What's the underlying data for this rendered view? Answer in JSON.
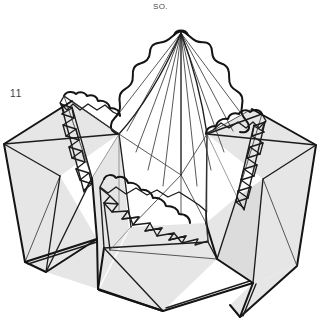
{
  "page": {
    "width": 321,
    "height": 327,
    "background_color": "#ffffff",
    "document_type": "origami-instruction-diagram"
  },
  "labels": {
    "top_caption": "SO.",
    "step_number": "11",
    "bottom_caption_partial": " "
  },
  "colors": {
    "ink": "#1a1a1a",
    "line_light": "#5a5a5a",
    "face_shaded": "#e6e6e6",
    "face_shaded_dark": "#dcdcdc",
    "face_white": "#ffffff",
    "background": "#ffffff",
    "label_text": "#3c3c3c",
    "caption_text": "#4a4a4a"
  },
  "figure": {
    "name": "folded-paper-model",
    "shaded_faces": [
      {
        "id": "left-outer-wing-upper",
        "points": "3,143 70,100 118,133 58,175",
        "fill": "#e6e6e6"
      },
      {
        "id": "left-outer-wing-lower",
        "points": "3,143 58,175 42,281 24,262",
        "fill": "#e6e6e6"
      },
      {
        "id": "left-outer-wing-lower2",
        "points": "58,175 95,238 42,281",
        "fill": "#e6e6e6"
      },
      {
        "id": "left-front-flap",
        "points": "90,180 118,133 128,226 96,290",
        "fill": "#e6e6e6"
      },
      {
        "id": "front-center-flap",
        "points": "96,290 128,226 205,222 215,260 160,312",
        "fill": "#e6e6e6"
      },
      {
        "id": "front-center-flap-lower",
        "points": "100,296 160,312 104,300",
        "fill": "#e6e6e6"
      },
      {
        "id": "right-front-flap",
        "points": "205,222 236,196 250,284 215,260",
        "fill": "#e6e6e6"
      },
      {
        "id": "right-outer-wing-upper",
        "points": "206,133 252,108 317,144 262,178",
        "fill": "#e6e6e6"
      },
      {
        "id": "right-outer-wing-lower",
        "points": "262,178 317,144 296,268 250,284",
        "fill": "#e6e6e6"
      },
      {
        "id": "right-outer-wing-lower2",
        "points": "236,196 262,178 250,284",
        "fill": "#dcdcdc"
      }
    ],
    "cones": [
      {
        "id": "center-cone",
        "apex_x": 181,
        "apex_y": 31,
        "description": "tall central pleated cone with radiating fold lines and scalloped edges"
      },
      {
        "id": "left-cone",
        "apex_x": 72,
        "apex_y": 95,
        "description": "small left pleated cone with zigzag pleat column"
      },
      {
        "id": "right-cone",
        "apex_x": 245,
        "apex_y": 113,
        "description": "small right pleated cone with zigzag pleat column"
      }
    ],
    "pleat_groups": [
      {
        "id": "left-pleat-column",
        "count": 10
      },
      {
        "id": "right-pleat-column",
        "count": 10
      },
      {
        "id": "front-pleat-band",
        "count": 9
      }
    ]
  }
}
